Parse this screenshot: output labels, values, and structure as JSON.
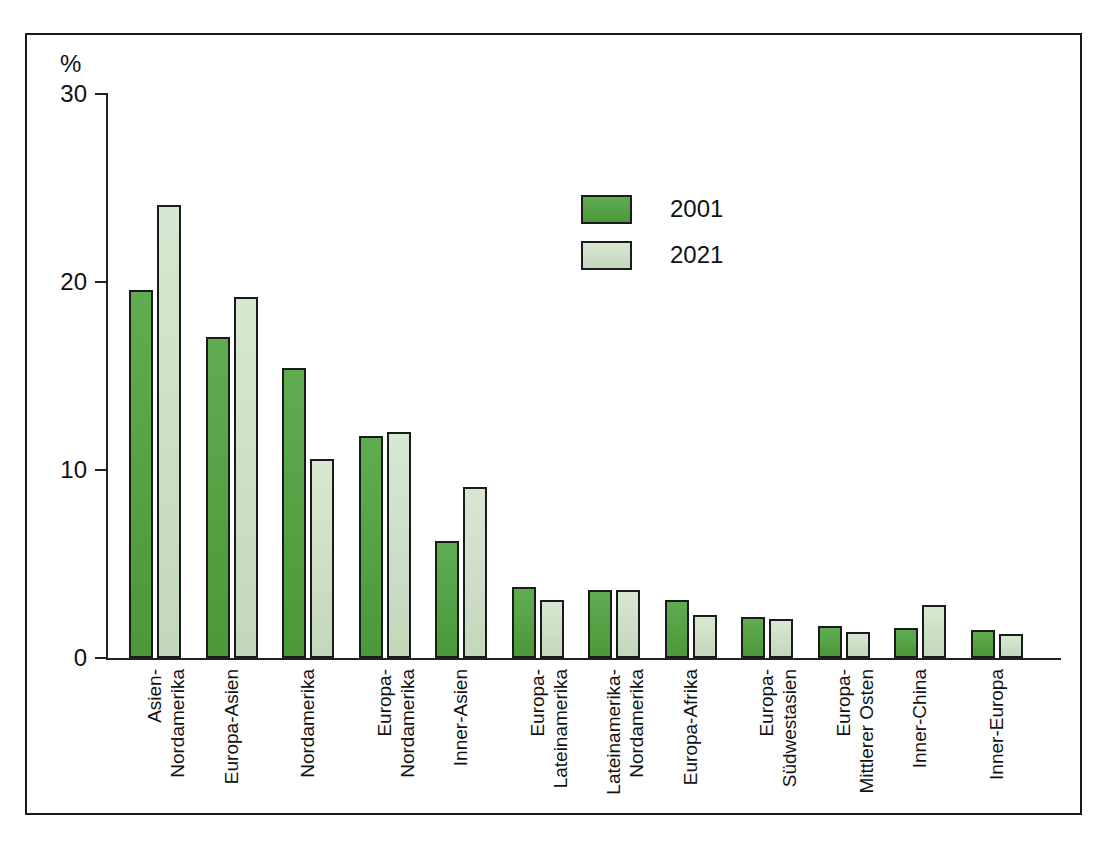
{
  "chart_data": {
    "type": "bar",
    "title": "",
    "subtitle": "",
    "xlabel": "",
    "ylabel": "%",
    "ylim": [
      0,
      30
    ],
    "yticks": [
      0,
      10,
      20,
      30
    ],
    "grid": false,
    "legend_position": "upper-center-right",
    "categories": [
      "Asien-Nordamerika",
      "Europa-Asien",
      "Nordamerika",
      "Europa-Nordamerika",
      "Inner-Asien",
      "Europa-Lateinamerika",
      "Lateinamerika-Nordamerika",
      "Europa-Afrika",
      "Europa-Südwestasien",
      "Europa-Mittlerer Osten",
      "Inner-China",
      "Inner-Europa"
    ],
    "category_lines": [
      [
        "Asien-",
        "Nordamerika"
      ],
      [
        "Europa-Asien",
        ""
      ],
      [
        "Nordamerika",
        ""
      ],
      [
        "Europa-",
        "Nordamerika"
      ],
      [
        "Inner-Asien",
        ""
      ],
      [
        "Europa-",
        "Lateinamerika"
      ],
      [
        "Lateinamerika-",
        "Nordamerika"
      ],
      [
        "Europa-Afrika",
        ""
      ],
      [
        "Europa-",
        "Südwestasien"
      ],
      [
        "Europa-",
        "Mittlerer Osten"
      ],
      [
        "Inner-China",
        ""
      ],
      [
        "Inner-Europa",
        ""
      ]
    ],
    "series": [
      {
        "name": "2001",
        "color": "#4fa23d",
        "values": [
          19.6,
          17.1,
          15.4,
          11.8,
          6.2,
          3.8,
          3.6,
          3.1,
          2.2,
          1.7,
          1.6,
          1.5
        ]
      },
      {
        "name": "2021",
        "color": "#cee3c7",
        "values": [
          24.1,
          19.2,
          10.6,
          12.0,
          9.1,
          3.1,
          3.6,
          2.3,
          2.1,
          1.4,
          2.8,
          1.3
        ]
      }
    ]
  },
  "legend": {
    "entries": [
      {
        "label": "2001",
        "swatch": "dark-green"
      },
      {
        "label": "2021",
        "swatch": "light-green"
      }
    ]
  },
  "axis": {
    "y_unit": "%",
    "y_tick_labels": [
      "30",
      "20",
      "10",
      "0"
    ]
  },
  "colors": {
    "series_2001": "#4fa23d",
    "series_2021": "#cee3c7",
    "frame": "#1a1a1a",
    "text": "#111111"
  }
}
